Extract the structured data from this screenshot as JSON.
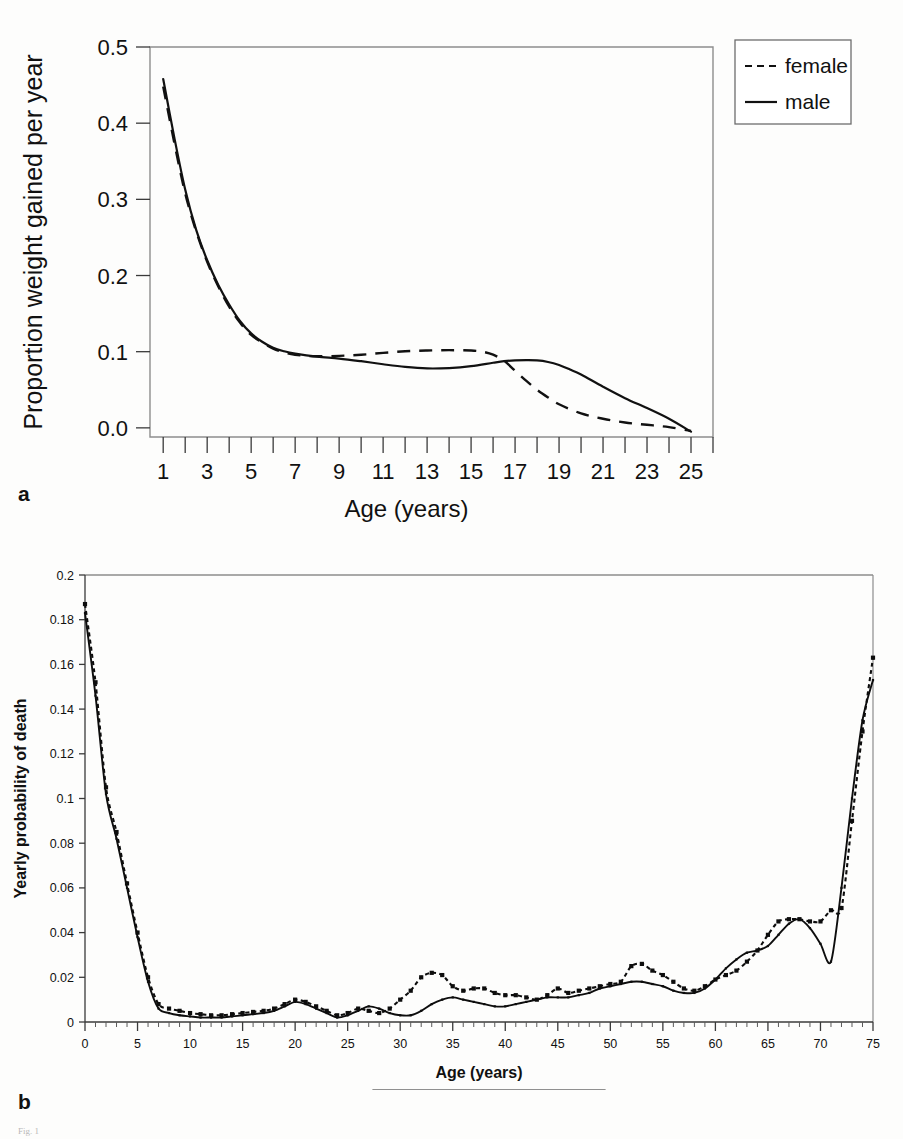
{
  "figure": {
    "panel_a_label": "a",
    "panel_b_label": "b",
    "caption_prefix": "Fig. 1",
    "caption_text": "Fig. 1"
  },
  "chart_data": [
    {
      "id": "panel_a",
      "type": "line",
      "title": "",
      "xlabel": "Age (years)",
      "ylabel": "Proportion weight gained per year",
      "xlim": [
        0.4,
        26.0
      ],
      "ylim": [
        -0.012,
        0.5
      ],
      "xticks": [
        1,
        3,
        5,
        7,
        9,
        11,
        13,
        15,
        17,
        19,
        21,
        23,
        25
      ],
      "xticklabels": [
        "1",
        "3",
        "5",
        "7",
        "9",
        "11",
        "13",
        "15",
        "17",
        "19",
        "21",
        "23",
        "25"
      ],
      "xticks_minor": [
        2,
        4,
        6,
        8,
        10,
        12,
        14,
        16,
        18,
        20,
        22,
        24,
        26
      ],
      "yticks": [
        0.0,
        0.1,
        0.2,
        0.3,
        0.4,
        0.5
      ],
      "yticklabels": [
        "0.0",
        "0.1",
        "0.2",
        "0.3",
        "0.4",
        "0.5"
      ],
      "grid": false,
      "legend_position": "outside-top-right",
      "series": [
        {
          "name": "female",
          "style": "dashed",
          "x": [
            1,
            1.5,
            2,
            2.5,
            3,
            3.5,
            4,
            4.5,
            5,
            5.5,
            6,
            6.5,
            7,
            7.5,
            8,
            9,
            10,
            11,
            12,
            13,
            14,
            15,
            15.5,
            16,
            16.5,
            17,
            17.5,
            18,
            18.5,
            19,
            20,
            21,
            22,
            23,
            24,
            25
          ],
          "values": [
            0.448,
            0.375,
            0.308,
            0.258,
            0.218,
            0.186,
            0.159,
            0.138,
            0.122,
            0.112,
            0.104,
            0.099,
            0.096,
            0.0945,
            0.094,
            0.0945,
            0.096,
            0.0985,
            0.1005,
            0.1015,
            0.102,
            0.1015,
            0.1,
            0.096,
            0.088,
            0.075,
            0.062,
            0.05,
            0.04,
            0.031,
            0.019,
            0.012,
            0.007,
            0.004,
            0.001,
            -0.004
          ]
        },
        {
          "name": "male",
          "style": "solid",
          "x": [
            1,
            1.5,
            2,
            2.5,
            3,
            3.5,
            4,
            4.5,
            5,
            5.5,
            6,
            6.5,
            7,
            8,
            9,
            10,
            11,
            12,
            13,
            14,
            15,
            16,
            16.5,
            17,
            17.5,
            18,
            18.5,
            19,
            19.5,
            20,
            21,
            22,
            23,
            24,
            25
          ],
          "values": [
            0.458,
            0.382,
            0.313,
            0.26,
            0.22,
            0.188,
            0.162,
            0.14,
            0.124,
            0.113,
            0.105,
            0.1005,
            0.0975,
            0.0935,
            0.091,
            0.0875,
            0.0835,
            0.08,
            0.078,
            0.0785,
            0.081,
            0.0855,
            0.0875,
            0.0885,
            0.0888,
            0.0885,
            0.0865,
            0.0825,
            0.0765,
            0.07,
            0.054,
            0.039,
            0.026,
            0.012,
            -0.005
          ]
        }
      ],
      "legend": [
        {
          "label": "female",
          "style": "dashed"
        },
        {
          "label": "male",
          "style": "solid"
        }
      ]
    },
    {
      "id": "panel_b",
      "type": "line",
      "title": "",
      "xlabel": "Age (years)",
      "ylabel": "Yearly probability of death",
      "xlim": [
        0,
        75
      ],
      "ylim": [
        0,
        0.2
      ],
      "xticks": [
        0,
        5,
        10,
        15,
        20,
        25,
        30,
        35,
        40,
        45,
        50,
        55,
        60,
        65,
        70,
        75
      ],
      "xticklabels": [
        "0",
        "5",
        "10",
        "15",
        "20",
        "25",
        "30",
        "35",
        "40",
        "45",
        "50",
        "55",
        "60",
        "65",
        "70",
        "75"
      ],
      "yticks": [
        0,
        0.02,
        0.04,
        0.06,
        0.08,
        0.1,
        0.12,
        0.14,
        0.16,
        0.18,
        0.2
      ],
      "yticklabels": [
        "0",
        "0.02",
        "0.04",
        "0.06",
        "0.08",
        "0.1",
        "0.12",
        "0.14",
        "0.16",
        "0.18",
        "0.2"
      ],
      "grid": false,
      "legend_position": "below",
      "x": [
        0,
        1,
        2,
        3,
        4,
        5,
        6,
        7,
        8,
        9,
        10,
        11,
        12,
        13,
        14,
        15,
        16,
        17,
        18,
        19,
        20,
        21,
        22,
        23,
        24,
        25,
        26,
        27,
        28,
        29,
        30,
        31,
        32,
        33,
        34,
        35,
        36,
        37,
        38,
        39,
        40,
        41,
        42,
        43,
        44,
        45,
        46,
        47,
        48,
        49,
        50,
        51,
        52,
        53,
        54,
        55,
        56,
        57,
        58,
        59,
        60,
        61,
        62,
        63,
        64,
        65,
        66,
        67,
        68,
        69,
        70,
        71,
        72,
        73,
        74,
        75
      ],
      "series": [
        {
          "name": "Males",
          "style": "solid-marker",
          "values": [
            0.183,
            0.146,
            0.102,
            0.082,
            0.06,
            0.038,
            0.018,
            0.006,
            0.004,
            0.003,
            0.0025,
            0.002,
            0.002,
            0.002,
            0.0025,
            0.003,
            0.0035,
            0.004,
            0.005,
            0.007,
            0.009,
            0.008,
            0.006,
            0.004,
            0.002,
            0.003,
            0.005,
            0.007,
            0.006,
            0.004,
            0.003,
            0.003,
            0.005,
            0.008,
            0.01,
            0.011,
            0.01,
            0.009,
            0.008,
            0.007,
            0.007,
            0.008,
            0.009,
            0.01,
            0.011,
            0.011,
            0.011,
            0.012,
            0.013,
            0.015,
            0.016,
            0.017,
            0.018,
            0.018,
            0.017,
            0.016,
            0.014,
            0.013,
            0.013,
            0.015,
            0.019,
            0.024,
            0.028,
            0.031,
            0.032,
            0.034,
            0.039,
            0.044,
            0.046,
            0.042,
            0.035,
            0.027,
            0.06,
            0.1,
            0.135,
            0.153
          ]
        },
        {
          "name": "Females",
          "style": "dashed-marker",
          "values": [
            0.187,
            0.152,
            0.105,
            0.085,
            0.062,
            0.04,
            0.02,
            0.008,
            0.006,
            0.005,
            0.004,
            0.0035,
            0.003,
            0.003,
            0.0035,
            0.004,
            0.0045,
            0.005,
            0.006,
            0.008,
            0.01,
            0.009,
            0.007,
            0.005,
            0.003,
            0.004,
            0.006,
            0.005,
            0.004,
            0.006,
            0.01,
            0.014,
            0.02,
            0.022,
            0.021,
            0.016,
            0.014,
            0.015,
            0.015,
            0.013,
            0.012,
            0.012,
            0.011,
            0.01,
            0.012,
            0.015,
            0.013,
            0.014,
            0.015,
            0.016,
            0.017,
            0.018,
            0.025,
            0.026,
            0.023,
            0.021,
            0.018,
            0.015,
            0.014,
            0.016,
            0.019,
            0.021,
            0.023,
            0.027,
            0.032,
            0.039,
            0.045,
            0.046,
            0.046,
            0.045,
            0.045,
            0.05,
            0.051,
            0.09,
            0.13,
            0.163
          ]
        }
      ],
      "legend": [
        {
          "label": "Males",
          "style": "solid-marker"
        },
        {
          "label": "Females",
          "style": "dashed-marker"
        }
      ]
    }
  ]
}
